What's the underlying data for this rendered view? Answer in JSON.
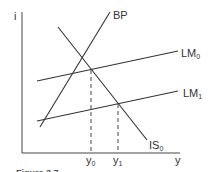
{
  "diagram": {
    "type": "IS-LM-BP diagram",
    "axes": {
      "y_axis_label": "i",
      "x_axis_label": "y"
    },
    "curves": [
      {
        "id": "BP",
        "label": "BP",
        "subscript": ""
      },
      {
        "id": "IS0",
        "label": "IS",
        "subscript": "0"
      },
      {
        "id": "LM0",
        "label": "LM",
        "subscript": "0"
      },
      {
        "id": "LM1",
        "label": "LM",
        "subscript": "1"
      }
    ],
    "x_markers": [
      {
        "label": "y",
        "subscript": "0"
      },
      {
        "label": "y",
        "subscript": "1"
      }
    ],
    "caption": "Figure 3.7",
    "colors": {
      "line": "#333333",
      "background": "#ffffff"
    }
  }
}
